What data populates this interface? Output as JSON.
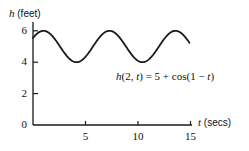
{
  "chart_data": {
    "type": "line",
    "title": "",
    "subtitle": "",
    "xlabel": "t (secs)",
    "ylabel": "h (feet)",
    "xlabel_var": "t",
    "xlabel_unit": "(secs)",
    "ylabel_var": "h",
    "ylabel_unit": "(feet)",
    "xlim": [
      0,
      16.5
    ],
    "ylim": [
      0,
      6.6
    ],
    "xticks": [
      5,
      10,
      15
    ],
    "xtick_labels": [
      "5",
      "10",
      "15"
    ],
    "yticks": [
      0,
      2,
      4,
      6
    ],
    "ytick_labels": [
      "0",
      "2",
      "4",
      "6"
    ],
    "grid": false,
    "legend": "none",
    "annotation": "h(2, t) = 5 + cos(1 − t)",
    "annotation_parts": {
      "h": "h",
      "open": "(2, ",
      "t1": "t",
      "eq": ") = 5 + cos(1 − ",
      "t2": "t",
      "close": ")"
    },
    "curve": {
      "name": "h(2,t)",
      "formula": "5 + cos(1 - t)",
      "amplitude": 1,
      "midline": 5,
      "period": 6.283,
      "phase": 1,
      "ymin": 4,
      "ymax": 6,
      "t_start": 0.0,
      "t_end": 14.9,
      "color": "#1a1a1a",
      "line_width": 1.8,
      "x": [
        0.0,
        0.5,
        1.0,
        1.5,
        2.0,
        2.5,
        3.0,
        3.5,
        4.0,
        4.5,
        5.0,
        5.5,
        6.0,
        6.5,
        7.0,
        7.5,
        8.0,
        8.5,
        9.0,
        9.5,
        10.0,
        10.5,
        11.0,
        11.5,
        12.0,
        12.5,
        13.0,
        13.5,
        14.0,
        14.5,
        14.9
      ],
      "y": [
        5.54,
        5.88,
        6.0,
        5.88,
        5.54,
        5.07,
        4.58,
        4.2,
        4.01,
        4.07,
        4.37,
        4.84,
        5.35,
        5.76,
        5.98,
        5.96,
        5.71,
        5.28,
        4.78,
        4.34,
        4.07,
        4.02,
        4.21,
        4.6,
        5.09,
        5.56,
        5.87,
        6.0,
        5.9,
        5.58,
        5.23
      ]
    },
    "axes_color": "#1a1a1a",
    "background": "#ffffff"
  },
  "geometry": {
    "origin_x": 33,
    "origin_y": 125,
    "x_scale": 10.5,
    "y_scale": 15.7,
    "axis_x_end": 192,
    "axis_y_top": 22
  }
}
